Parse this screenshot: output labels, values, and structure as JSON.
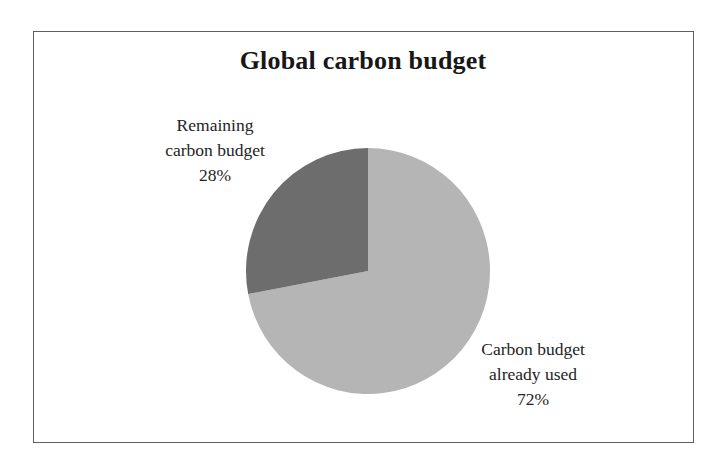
{
  "figure": {
    "title": "Global carbon budget",
    "frame_color": "#5e5e5e",
    "background": "#ffffff"
  },
  "labels": {
    "remaining": {
      "line1": "Remaining",
      "line2": "carbon budget",
      "value": "28%"
    },
    "used": {
      "line1": "Carbon budget",
      "line2": "already used",
      "value": "72%"
    }
  },
  "chart_data": {
    "type": "pie",
    "title": "Global carbon budget",
    "xlabel": "",
    "ylabel": "",
    "categories": [
      "Carbon budget already used",
      "Remaining carbon budget"
    ],
    "values": [
      72,
      28
    ],
    "unit": "%",
    "slices": [
      {
        "label": "Carbon budget already used",
        "value": 72,
        "display_value": "72%",
        "color": "#b5b5b5",
        "start_angle_deg": 0,
        "end_angle_deg": 259.2
      },
      {
        "label": "Remaining carbon budget",
        "value": 28,
        "display_value": "28%",
        "color": "#6d6d6d",
        "start_angle_deg": 259.2,
        "end_angle_deg": 360
      }
    ],
    "start_angle_note": "first slice begins at 12 o'clock, drawn clockwise",
    "legend": "none (direct callout labels)",
    "grid": false,
    "annotations": [
      "Remaining carbon budget 28%",
      "Carbon budget already used 72%"
    ]
  }
}
